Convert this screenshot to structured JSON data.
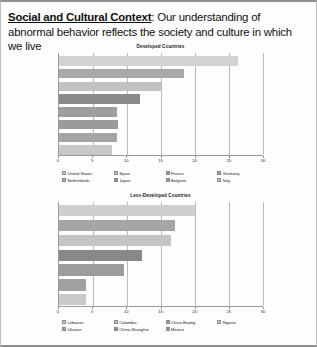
{
  "slide": {
    "heading_lead": "Social and Cultural Context",
    "heading_rest": ": Our understanding of abnormal behavior reflects the society and culture in which we live"
  },
  "chart_data": [
    {
      "type": "bar",
      "orientation": "horizontal",
      "title": "Developed Countries",
      "xlabel": "",
      "ylabel": "",
      "xlim": [
        0,
        30
      ],
      "ticks": [
        "0",
        "5",
        "10",
        "15",
        "20",
        "25",
        "30"
      ],
      "tick_values": [
        0,
        5,
        10,
        15,
        20,
        25,
        30
      ],
      "grid": true,
      "legend_position": "bottom",
      "categories": [
        "United States",
        "Netherlands",
        "Spain",
        "Japan",
        "France",
        "Belgium",
        "Germany",
        "Italy"
      ],
      "values": [
        26.3,
        18.4,
        15.0,
        11.9,
        8.6,
        8.7,
        8.6,
        7.8
      ],
      "colors": [
        "#d2d2d2",
        "#a8a8a8",
        "#c2c2c2",
        "#8a8a8a",
        "#9e9e9e",
        "#9b9b9b",
        "#a4a4a4",
        "#c8c8c8"
      ]
    },
    {
      "type": "bar",
      "orientation": "horizontal",
      "title": "Less-Developed Countries",
      "xlabel": "",
      "ylabel": "",
      "xlim": [
        0,
        30
      ],
      "ticks": [
        "0",
        "5",
        "10",
        "15",
        "20",
        "25",
        "30"
      ],
      "tick_values": [
        0,
        5,
        10,
        15,
        20,
        25,
        30
      ],
      "grid": true,
      "legend_position": "bottom",
      "categories": [
        "Lebanon",
        "Ukraine",
        "Colombia",
        "China-Shanghai",
        "China-Beijing",
        "Mexico",
        "Nigeria"
      ],
      "values": [
        20.0,
        17.0,
        16.5,
        12.2,
        9.5,
        4.0,
        4.0
      ],
      "colors": [
        "#cfcfcf",
        "#a6a6a6",
        "#c4c4c4",
        "#888888",
        "#9c9c9c",
        "#a0a0a0",
        "#c9c9c9"
      ]
    }
  ]
}
